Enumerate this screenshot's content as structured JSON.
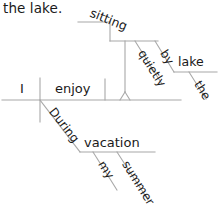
{
  "diagram": {
    "type": "reed-kellogg-sentence-diagram",
    "caption_fragment": "the lake.",
    "sentence": "During my summer vacation I enjoy sitting quietly by the lake.",
    "line_color": "#a8a8a8",
    "text_color": "#1a1a1a",
    "background": "#ffffff",
    "words": {
      "subject": "I",
      "verb": "enjoy",
      "gerund_object": "sitting",
      "adverb": "quietly",
      "preposition_right": "by",
      "object_of_prep_right": "lake",
      "article_right": "the",
      "preposition_left": "During",
      "object_of_prep_left": "vacation",
      "possessive": "my",
      "adjective": "summer"
    }
  }
}
